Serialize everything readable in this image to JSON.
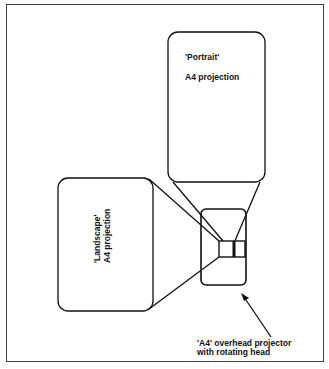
{
  "diagram": {
    "portrait_box": {
      "title": "'Portrait'",
      "subtitle": "A4 projection"
    },
    "landscape_box": {
      "title": "'Landscape'",
      "subtitle": "A4 projection"
    },
    "projector_caption": {
      "line1": "'A4' overhead projector",
      "line2": "with rotating head"
    },
    "colors": {
      "stroke": "#111111",
      "frame": "#444444",
      "background": "#ffffff"
    }
  }
}
